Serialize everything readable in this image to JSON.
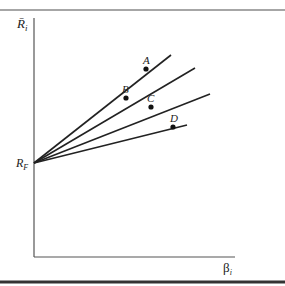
{
  "diagram": {
    "y_axis_label": "R̄",
    "y_axis_sub": "i",
    "x_axis_label": "β",
    "x_axis_sub": "i",
    "intercept_label": "R",
    "intercept_sub": "F",
    "origin": {
      "x": 34,
      "y": 163
    },
    "lines": [
      {
        "name": "A",
        "end": {
          "x": 171,
          "y": 55
        },
        "point": {
          "x": 146,
          "y": 69
        },
        "label_pos": {
          "x": 143,
          "y": 64
        }
      },
      {
        "name": "B",
        "end": {
          "x": 195,
          "y": 68
        },
        "point": {
          "x": 126,
          "y": 98
        },
        "label_pos": {
          "x": 122,
          "y": 93
        }
      },
      {
        "name": "C",
        "end": {
          "x": 210,
          "y": 94
        },
        "point": {
          "x": 151,
          "y": 107
        },
        "label_pos": {
          "x": 147,
          "y": 102
        }
      },
      {
        "name": "D",
        "end": {
          "x": 187,
          "y": 125
        },
        "point": {
          "x": 173,
          "y": 127
        },
        "label_pos": {
          "x": 170,
          "y": 122
        }
      }
    ],
    "colors": {
      "line": "#222222",
      "rule": "#666666",
      "axis": "#555555"
    }
  }
}
